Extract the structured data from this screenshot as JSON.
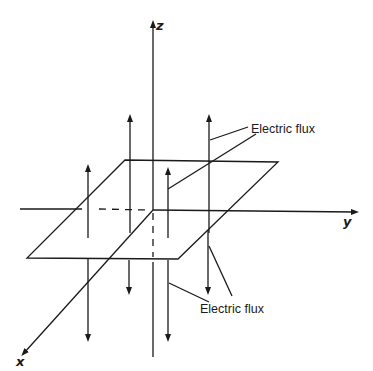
{
  "diagram": {
    "axes": {
      "z": {
        "label": "z"
      },
      "y": {
        "label": "y"
      },
      "x": {
        "label": "x"
      }
    },
    "annotations": [
      {
        "id": "upper",
        "text": "Electric flux"
      },
      {
        "id": "lower",
        "text": "Electric flux"
      }
    ],
    "plane": {
      "corners": [
        [
          125,
          160
        ],
        [
          278,
          162
        ],
        [
          178,
          259
        ],
        [
          27,
          258
        ]
      ]
    },
    "flux_up_count": 4,
    "flux_down_count": 4,
    "colors": {
      "line": "#1a1a1a",
      "background": "#ffffff"
    }
  }
}
